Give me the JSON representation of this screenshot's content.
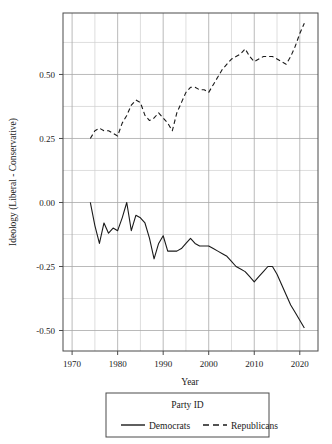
{
  "chart_data": {
    "type": "line",
    "title": "",
    "xlabel": "Year",
    "ylabel": "Ideology (Liberal - Conservative)",
    "xlim": [
      1968,
      2024
    ],
    "ylim": [
      -0.58,
      0.74
    ],
    "xticks": [
      1970,
      1980,
      1990,
      2000,
      2010,
      2020
    ],
    "xtick_labels": [
      "1970",
      "1980",
      "1990",
      "2000",
      "2010",
      "2020"
    ],
    "xminor": [
      1975,
      1985,
      1995,
      2005,
      2015
    ],
    "yticks": [
      0.5,
      0.25,
      0.0,
      -0.25,
      -0.5
    ],
    "ytick_labels": [
      "0.50",
      "0.25",
      "0.00",
      "-0.25",
      "-0.50"
    ],
    "yminor": [
      0.625,
      0.375,
      0.125,
      -0.125,
      -0.375
    ],
    "grid": true,
    "legend_position": "bottom",
    "legend_title": "Party ID",
    "series": [
      {
        "name": "Democrats",
        "style": "solid",
        "color": "#1a1a1a",
        "x": [
          1974,
          1975,
          1976,
          1977,
          1978,
          1979,
          1980,
          1981,
          1982,
          1983,
          1984,
          1985,
          1986,
          1987,
          1988,
          1989,
          1990,
          1991,
          1992,
          1993,
          1994,
          1995,
          1996,
          1997,
          1998,
          1999,
          2000,
          2001,
          2002,
          2003,
          2004,
          2005,
          2006,
          2007,
          2008,
          2009,
          2010,
          2011,
          2012,
          2013,
          2014,
          2015,
          2016,
          2017,
          2018,
          2019,
          2020,
          2021
        ],
        "y": [
          0.0,
          -0.09,
          -0.16,
          -0.08,
          -0.12,
          -0.1,
          -0.11,
          -0.06,
          0.0,
          -0.11,
          -0.05,
          -0.06,
          -0.08,
          -0.14,
          -0.22,
          -0.16,
          -0.13,
          -0.19,
          -0.19,
          -0.19,
          -0.18,
          -0.16,
          -0.14,
          -0.16,
          -0.17,
          -0.17,
          -0.17,
          -0.18,
          -0.19,
          -0.2,
          -0.21,
          -0.23,
          -0.25,
          -0.26,
          -0.27,
          -0.29,
          -0.31,
          -0.29,
          -0.27,
          -0.25,
          -0.25,
          -0.28,
          -0.32,
          -0.36,
          -0.4,
          -0.43,
          -0.46,
          -0.49
        ]
      },
      {
        "name": "Republicans",
        "style": "dashed",
        "color": "#1a1a1a",
        "x": [
          1974,
          1975,
          1976,
          1977,
          1978,
          1979,
          1980,
          1981,
          1982,
          1983,
          1984,
          1985,
          1986,
          1987,
          1988,
          1989,
          1990,
          1991,
          1992,
          1993,
          1994,
          1995,
          1996,
          1997,
          1998,
          1999,
          2000,
          2001,
          2002,
          2003,
          2004,
          2005,
          2006,
          2007,
          2008,
          2009,
          2010,
          2011,
          2012,
          2013,
          2014,
          2015,
          2016,
          2017,
          2018,
          2019,
          2020,
          2021
        ],
        "y": [
          0.25,
          0.28,
          0.29,
          0.28,
          0.28,
          0.27,
          0.26,
          0.31,
          0.34,
          0.38,
          0.4,
          0.39,
          0.34,
          0.32,
          0.33,
          0.35,
          0.33,
          0.31,
          0.28,
          0.35,
          0.39,
          0.43,
          0.45,
          0.45,
          0.44,
          0.44,
          0.43,
          0.46,
          0.49,
          0.52,
          0.54,
          0.56,
          0.57,
          0.58,
          0.6,
          0.57,
          0.55,
          0.56,
          0.57,
          0.57,
          0.57,
          0.56,
          0.55,
          0.54,
          0.57,
          0.61,
          0.66,
          0.7
        ]
      }
    ]
  },
  "legend": {
    "title": "Party ID",
    "entries": [
      {
        "label": "Democrats",
        "style": "solid"
      },
      {
        "label": "Republicans",
        "style": "dashed"
      }
    ]
  },
  "axes": {
    "x_title": "Year",
    "y_title": "Ideology (Liberal - Conservative)"
  }
}
